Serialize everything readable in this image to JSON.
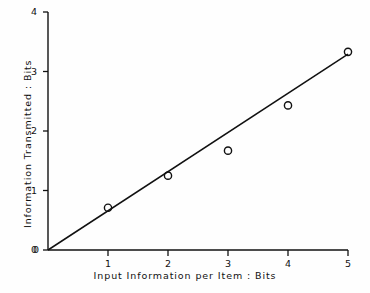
{
  "chart_data": {
    "type": "scatter",
    "title": "",
    "xlabel": "Input  Information per Item : Bits",
    "ylabel": "Information Transmitted : Bits",
    "xlim": [
      0,
      5
    ],
    "ylim": [
      0,
      4
    ],
    "xticks": [
      "0",
      "1",
      "2",
      "3",
      "4",
      "5"
    ],
    "yticks": [
      "0",
      "1",
      "2",
      "3",
      "4"
    ],
    "xtick_values": [
      0,
      1,
      2,
      3,
      4,
      5
    ],
    "ytick_values": [
      0,
      1,
      2,
      3,
      4
    ],
    "grid": false,
    "legend": null,
    "marker": "open-circle",
    "x": [
      1,
      2,
      3,
      4,
      5
    ],
    "values": [
      0.71,
      1.25,
      1.67,
      2.43,
      3.33
    ],
    "series": [
      {
        "name": "Information transmitted",
        "type": "scatter",
        "x": [
          1,
          2,
          3,
          4,
          5
        ],
        "values": [
          0.71,
          1.25,
          1.67,
          2.43,
          3.33
        ]
      },
      {
        "name": "fitted line",
        "type": "line",
        "x": [
          0,
          5
        ],
        "values": [
          0,
          3.29
        ]
      }
    ],
    "annotations": []
  },
  "axes": {
    "x_tick_labels": [
      "0",
      "1",
      "2",
      "3",
      "4",
      "5"
    ],
    "y_tick_labels": [
      "0",
      "1",
      "2",
      "3",
      "4"
    ],
    "x_axis_title": "Input  Information per Item : Bits",
    "y_axis_title": "Information Transmitted : Bits"
  },
  "style": {
    "ink": "#111111",
    "background": "#fefefe",
    "marker_stroke": "#111111",
    "line_stroke": "#111111"
  }
}
